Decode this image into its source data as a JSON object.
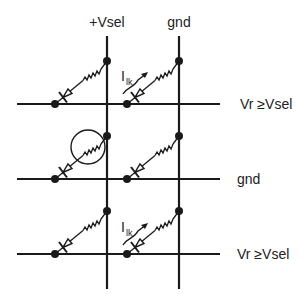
{
  "columns": [
    {
      "label": "+Vsel",
      "x": 107
    },
    {
      "label": "gnd",
      "x": 179
    }
  ],
  "rows": [
    {
      "label": "Vr ≥Vsel",
      "y": 104
    },
    {
      "label": "gnd",
      "y": 179
    },
    {
      "label": "Vr ≥Vsel",
      "y": 254
    }
  ],
  "leakage_current_label": {
    "main": "I",
    "sub": "lk"
  },
  "highlighted_cell": {
    "row": 1,
    "col": 0
  },
  "colors": {
    "line": "#1a1a1a",
    "background": "#ffffff"
  }
}
